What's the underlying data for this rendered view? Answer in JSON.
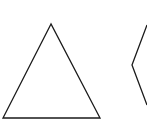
{
  "diagram": {
    "background": "#ffffff",
    "stroke_color": "#1a1a1a",
    "shapes": [
      {
        "name": "triangle",
        "points": "51,24 3,118 100,118"
      },
      {
        "name": "partial-polygon",
        "points": "147,25 132,65 147,105"
      }
    ]
  }
}
